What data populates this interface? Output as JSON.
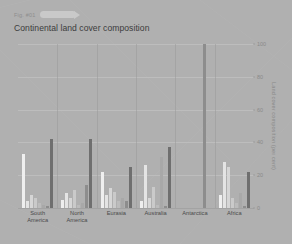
{
  "header": {
    "fig_label": "Fig. #01",
    "pill_icon": "pill-arrow-icon",
    "title": "Continental land cover composition"
  },
  "colors": {
    "background": "#b0b0b0",
    "gridline": "#bdbdbd",
    "divider": "#9a9a9a",
    "tick_text": "#8a8a8a",
    "title_text": "#3c3c3c",
    "bar_palette": [
      "#efefef",
      "#e4e4e4",
      "#d6d6d6",
      "#cacaca",
      "#bcbcbc",
      "#a8a8a8",
      "#8d8d8d",
      "#6f6f6f"
    ]
  },
  "chart_data": {
    "type": "bar",
    "title": "Continental land cover composition",
    "xlabel": "",
    "ylabel": "Land cover composition (per cent)",
    "ylim": [
      0,
      100
    ],
    "yticks": [
      0,
      20,
      40,
      60,
      80,
      100
    ],
    "grid": true,
    "legend": "none",
    "categories": [
      "South America",
      "North America",
      "Eurasia",
      "Australia",
      "Antarctica",
      "Africa"
    ],
    "series": [
      {
        "name": "Forest",
        "color": "#efefef",
        "values": [
          33,
          5,
          22,
          4,
          0,
          8
        ]
      },
      {
        "name": "Shrubland",
        "color": "#e4e4e4",
        "values": [
          4,
          9,
          8,
          26,
          0,
          28
        ]
      },
      {
        "name": "Grassland",
        "color": "#d6d6d6",
        "values": [
          8,
          6,
          12,
          6,
          0,
          25
        ]
      },
      {
        "name": "Cropland",
        "color": "#cacaca",
        "values": [
          6,
          11,
          10,
          13,
          0,
          6
        ]
      },
      {
        "name": "Wetland",
        "color": "#bcbcbc",
        "values": [
          3,
          2,
          4,
          2,
          0,
          3
        ]
      },
      {
        "name": "Barren",
        "color": "#a8a8a8",
        "values": [
          2,
          3,
          6,
          31,
          0,
          9
        ]
      },
      {
        "name": "Snow & ice",
        "color": "#8d8d8d",
        "values": [
          1,
          14,
          4,
          1,
          100,
          1
        ]
      },
      {
        "name": "Other",
        "color": "#6f6f6f",
        "values": [
          42,
          42,
          25,
          37,
          0,
          22
        ]
      }
    ]
  }
}
